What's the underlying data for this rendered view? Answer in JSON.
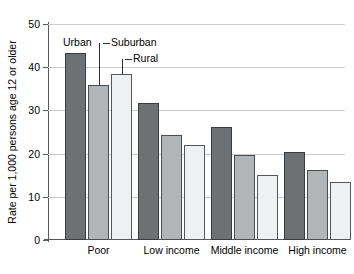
{
  "chart_data": {
    "type": "bar",
    "title": "",
    "subtitle": "",
    "xlabel": "",
    "ylabel": "Rate per 1,000 persons age 12 or older",
    "ylim": [
      0,
      50
    ],
    "yticks": [
      0,
      10,
      20,
      30,
      40,
      50
    ],
    "ytick_labels": [
      "0",
      "10",
      "20",
      "30",
      "40",
      "50"
    ],
    "grid": "horizontal",
    "legend_position": "inline-callouts",
    "categories": [
      "Poor",
      "Low income",
      "Middle income",
      "High income"
    ],
    "series": [
      {
        "name": "Urban",
        "color": "#6e7174",
        "values": [
          43.3,
          31.7,
          26.2,
          20.3
        ]
      },
      {
        "name": "Suburban",
        "color": "#b2b5b8",
        "values": [
          35.9,
          24.3,
          19.7,
          16.2
        ]
      },
      {
        "name": "Rural",
        "color": "#eff0f1",
        "values": [
          38.4,
          22.0,
          15.0,
          13.4
        ]
      }
    ],
    "annotations": [
      {
        "text": "Urban",
        "points_to": "Poor/Urban"
      },
      {
        "text": "Suburban",
        "points_to": "Poor/Suburban"
      },
      {
        "text": "Rural",
        "points_to": "Poor/Rural"
      }
    ]
  }
}
